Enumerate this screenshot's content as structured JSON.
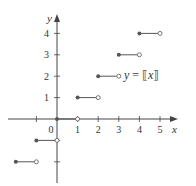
{
  "chart_data": {
    "type": "line",
    "title": "",
    "function_label": "y = ⟦x⟧",
    "function_label_parts": {
      "prefix": "y = ",
      "bracket_open": "⟦",
      "var": "x",
      "bracket_close": "⟧"
    },
    "xlabel": "x",
    "ylabel": "y",
    "xlim": [
      -2,
      5.8
    ],
    "ylim": [
      -2.6,
      5
    ],
    "x_ticks": [
      -1,
      0,
      1,
      2,
      3,
      4,
      5
    ],
    "x_tick_labels": [
      "",
      "0",
      "1",
      "2",
      "3",
      "4",
      "5"
    ],
    "y_ticks": [
      -2,
      -1,
      1,
      2,
      3,
      4
    ],
    "y_tick_labels": [
      "",
      "",
      "1",
      "2",
      "3",
      "4"
    ],
    "grid": false,
    "legend": null,
    "series": [
      {
        "name": "greatest integer function",
        "segments": [
          {
            "x_start": -2,
            "x_end": -1,
            "y": -2,
            "start_closed": true,
            "end_closed": false
          },
          {
            "x_start": -1,
            "x_end": 0,
            "y": -1,
            "start_closed": true,
            "end_closed": false
          },
          {
            "x_start": 0,
            "x_end": 1,
            "y": 0,
            "start_closed": true,
            "end_closed": false
          },
          {
            "x_start": 1,
            "x_end": 2,
            "y": 1,
            "start_closed": true,
            "end_closed": false
          },
          {
            "x_start": 2,
            "x_end": 3,
            "y": 2,
            "start_closed": true,
            "end_closed": false
          },
          {
            "x_start": 3,
            "x_end": 4,
            "y": 3,
            "start_closed": true,
            "end_closed": false
          },
          {
            "x_start": 4,
            "x_end": 5,
            "y": 4,
            "start_closed": true,
            "end_closed": false
          }
        ]
      }
    ]
  },
  "colors": {
    "axis": "#444444",
    "line": "#555555",
    "text": "#333333"
  }
}
